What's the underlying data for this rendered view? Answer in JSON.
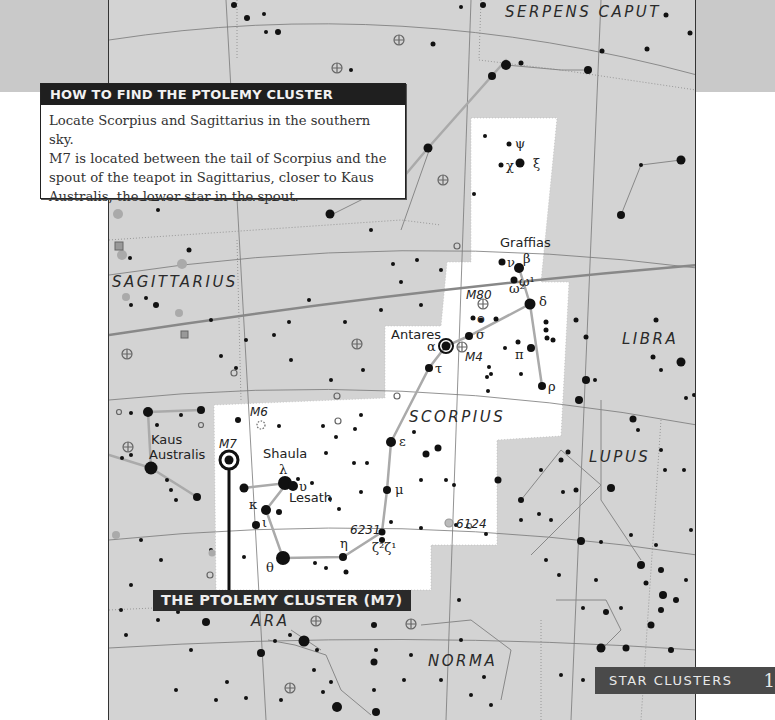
{
  "info_box": {
    "title": "HOW TO FIND THE PTOLEMY CLUSTER",
    "body_lines": [
      "Locate Scorpius and Sagittarius in the southern sky.",
      "M7 is located between the tail of Scorpius and the",
      "spout of the teapot in Sagittarius, closer to Kaus",
      "Australis, the lower star in the spout."
    ]
  },
  "constellations": {
    "serpens_caput": "SERPENS CAPUT",
    "serpens_cauda": "SERPENS CAUDA",
    "sagittarius": "SAGITTARIUS",
    "scorpius": "SCORPIUS",
    "libra": "LIBRA",
    "lupus": "LUPUS",
    "ara": "ARA",
    "norma": "NORMA"
  },
  "stars": {
    "graffias": "Graffias",
    "antares": "Antares",
    "shaula": "Shaula",
    "lesath": "Lesath",
    "kaus_australis_1": "Kaus",
    "kaus_australis_2": "Australis"
  },
  "greek": {
    "psi": "ψ",
    "chi": "χ",
    "xi": "ξ",
    "nu": "ν",
    "beta": "β",
    "omega1": "ω¹",
    "omega2": "ω²",
    "delta": "δ",
    "omicron": "ο",
    "sigma": "σ",
    "alpha": "α",
    "tau": "τ",
    "pi": "π",
    "rho": "ρ",
    "epsilon": "ε",
    "mu": "μ",
    "lambda": "λ",
    "upsilon": "υ",
    "kappa": "κ",
    "iota": "ι",
    "theta": "θ",
    "eta": "η",
    "zeta": "ζ²ζ¹"
  },
  "deep_sky": {
    "m80": "M80",
    "m4": "M4",
    "m6": "M6",
    "m7": "M7",
    "ngc6231": "6231",
    "ngc6124": "6124"
  },
  "callout": {
    "label": "THE PTOLEMY CLUSTER (M7)"
  },
  "footer": {
    "section": "STAR CLUSTERS",
    "page": "1"
  },
  "colors": {
    "sky_gray": "#d3d3d3",
    "highlight_white": "#ffffff",
    "header_dark": "#1f1f1f",
    "footer_tab": "#4a4a4a",
    "line_gray": "#9a9a9a",
    "star_black": "#111111"
  }
}
